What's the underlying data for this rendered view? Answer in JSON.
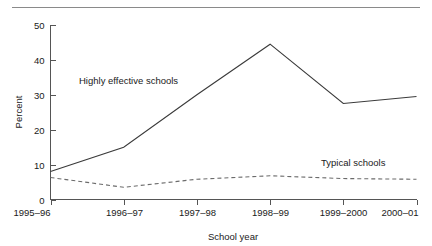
{
  "chart_data": {
    "type": "line",
    "title": "",
    "xlabel": "School year",
    "ylabel": "Percent",
    "categories": [
      "1995–96",
      "1996–97",
      "1997–98",
      "1998–99",
      "1999–2000",
      "2000–01"
    ],
    "ylim": [
      0,
      50
    ],
    "yticks": [
      0,
      10,
      20,
      30,
      40,
      50
    ],
    "ytick_labels": [
      "0",
      "10",
      "20",
      "30",
      "40",
      "50"
    ],
    "grid": false,
    "legend": "inline-annotations",
    "series": [
      {
        "name": "Highly effective schools",
        "style": "solid",
        "color": "#3a3a3a",
        "values": [
          8,
          15,
          30,
          44.5,
          27.5,
          29.5
        ]
      },
      {
        "name": "Typical schools",
        "style": "dashed",
        "color": "#6b6b6b",
        "values": [
          6.3,
          3.5,
          5.8,
          6.8,
          6,
          5.8
        ]
      }
    ],
    "annotations": [
      {
        "text": "Highly effective schools",
        "x_px": 79,
        "y_px": 84
      },
      {
        "text": "Typical schools",
        "x_px": 321,
        "y_px": 166
      }
    ]
  },
  "decor": {
    "top_rule_color": "#8a8a8a"
  }
}
